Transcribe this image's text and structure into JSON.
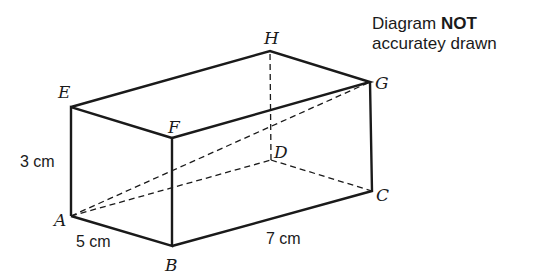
{
  "note": {
    "line1_prefix": "Diagram ",
    "line1_bold": "NOT",
    "line2": "accuratey drawn"
  },
  "vertices": {
    "A": {
      "label": "A",
      "x": 71,
      "y": 216
    },
    "B": {
      "label": "B",
      "x": 172,
      "y": 246
    },
    "C": {
      "label": "C",
      "x": 372,
      "y": 191
    },
    "D": {
      "label": "D",
      "x": 271,
      "y": 160
    },
    "E": {
      "label": "E",
      "x": 71,
      "y": 107
    },
    "F": {
      "label": "F",
      "x": 172,
      "y": 138
    },
    "G": {
      "label": "G",
      "x": 370,
      "y": 82
    },
    "H": {
      "label": "H",
      "x": 270,
      "y": 51
    }
  },
  "dimensions": {
    "height": "3 cm",
    "width": "5 cm",
    "length": "7 cm"
  },
  "colors": {
    "line": "#1a1a1a",
    "background": "#ffffff"
  }
}
